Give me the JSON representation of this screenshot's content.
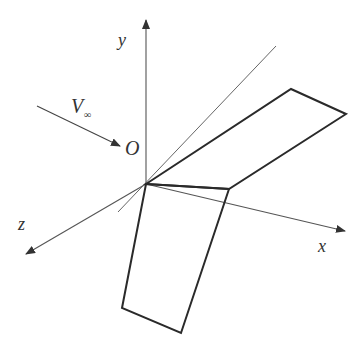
{
  "diagram": {
    "labels": {
      "y_axis": "y",
      "x_axis": "x",
      "z_axis": "z",
      "origin": "O",
      "freestream": "V",
      "freestream_sub": "∞"
    },
    "colors": {
      "axis": "#555555",
      "wing": "#2a2a2a",
      "text": "#333333",
      "background": "#ffffff"
    },
    "geometry": {
      "origin": [
        146,
        184
      ],
      "y_axis_tip": [
        146,
        18
      ],
      "x_axis_tip": [
        346,
        231
      ],
      "z_axis_tip": [
        25,
        255
      ],
      "diag_line_start": [
        146,
        184
      ],
      "diag_line_end": [
        276,
        46
      ],
      "diag_line_back": [
        118,
        212
      ],
      "freestream_start": [
        37,
        106
      ],
      "freestream_tip": [
        121,
        146
      ],
      "wing_upper": [
        [
          146,
          184
        ],
        [
          291,
          89
        ],
        [
          346,
          114
        ],
        [
          229,
          189
        ]
      ],
      "wing_lower": [
        [
          146,
          184
        ],
        [
          229,
          189
        ],
        [
          181,
          333
        ],
        [
          122,
          308
        ]
      ]
    }
  }
}
